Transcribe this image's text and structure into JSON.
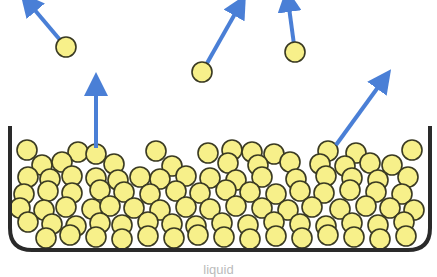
{
  "diagram": {
    "caption": "liquid",
    "colors": {
      "molecule_fill": "#f7f08a",
      "molecule_stroke": "#3a3a22",
      "arrow": "#4a7fd6",
      "container": "#2a2a2a"
    },
    "escaping_molecules": [
      {
        "cx": 66,
        "cy": 47,
        "ax": 28,
        "ay": 2
      },
      {
        "cx": 202,
        "cy": 72,
        "ax": 240,
        "ay": 5
      },
      {
        "cx": 295,
        "cy": 52,
        "ax": 288,
        "ay": 0
      }
    ],
    "surface_arrows": [
      {
        "x1": 96,
        "y1": 148,
        "x2": 96,
        "y2": 84
      },
      {
        "x1": 336,
        "y1": 145,
        "x2": 384,
        "y2": 79
      }
    ]
  }
}
